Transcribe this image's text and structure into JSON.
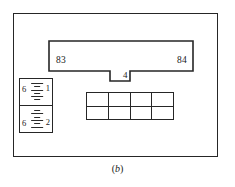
{
  "figure": {
    "caption_open": "(",
    "caption_letter": "b",
    "caption_close": ")",
    "line_color": "#262626",
    "background_color": "#ffffff",
    "text_color": "#1a1a1a"
  },
  "bar": {
    "left_label": "83",
    "right_label": "84",
    "tab_label": "4"
  },
  "ruler": {
    "segments": [
      {
        "left_number": "6",
        "right_number": "1",
        "tick_count": 6
      },
      {
        "left_number": "6",
        "right_number": "2",
        "tick_count": 6
      }
    ]
  },
  "grid": {
    "columns": 4,
    "rows": 2,
    "cells": [
      [
        "",
        "",
        "",
        ""
      ],
      [
        "",
        "",
        "",
        ""
      ]
    ]
  }
}
